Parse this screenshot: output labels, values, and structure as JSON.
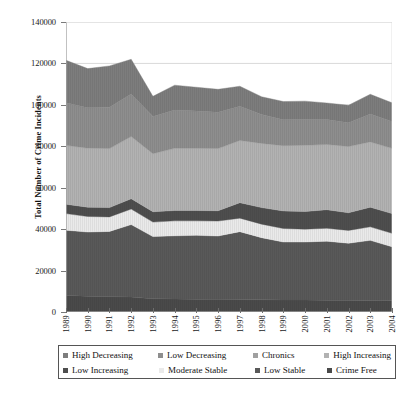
{
  "chart_data": {
    "type": "area",
    "stacked": true,
    "title": "",
    "xlabel": "",
    "ylabel": "Total Number of Crime Incidents",
    "ylim": [
      0,
      140000
    ],
    "ytick_values": [
      0,
      20000,
      40000,
      60000,
      80000,
      100000,
      120000,
      140000
    ],
    "ytick_labels": [
      "0",
      "20000",
      "40000",
      "60000",
      "80000",
      "100000",
      "120000",
      "140000"
    ],
    "grid": true,
    "legend_position": "bottom",
    "categories": [
      "1989",
      "1990",
      "1991",
      "1992",
      "1993",
      "1994",
      "1995",
      "1996",
      "1997",
      "1998",
      "1999",
      "2000",
      "2001",
      "2002",
      "2003",
      "2004"
    ],
    "series": [
      {
        "name": "Crime Free",
        "color": "#4a4a4a",
        "values": [
          8000,
          7600,
          7400,
          7200,
          6400,
          6300,
          6200,
          6100,
          6000,
          5900,
          5800,
          5800,
          5700,
          5700,
          5600,
          5500
        ]
      },
      {
        "name": "Low Stable",
        "color": "#595959",
        "values": [
          31500,
          31000,
          31500,
          35000,
          30000,
          30500,
          30800,
          30600,
          32800,
          30000,
          28000,
          28000,
          28500,
          27500,
          29000,
          26000
        ]
      },
      {
        "name": "Moderate Stable",
        "color": "#eaeaea",
        "values": [
          8000,
          7500,
          7000,
          7500,
          7000,
          7200,
          7000,
          7200,
          6500,
          6500,
          6500,
          6200,
          6200,
          6200,
          6500,
          6500
        ]
      },
      {
        "name": "Low Increasing",
        "color": "#4e4e4e",
        "values": [
          4500,
          4500,
          4500,
          5000,
          5000,
          5000,
          5000,
          5000,
          7500,
          8000,
          8500,
          8500,
          9000,
          8500,
          9500,
          9500
        ]
      },
      {
        "name": "High Increasing",
        "color": "#b2b2b2",
        "values": [
          28500,
          28500,
          28500,
          30000,
          28000,
          30000,
          30000,
          30000,
          30000,
          31000,
          31500,
          32000,
          31500,
          32000,
          31500,
          31500
        ]
      },
      {
        "name": "Chronics",
        "color": "#a0a0a0",
        "values": [
          0,
          0,
          0,
          0,
          0,
          0,
          0,
          0,
          0,
          0,
          0,
          0,
          0,
          0,
          0,
          0
        ]
      },
      {
        "name": "Low Decreasing",
        "color": "#8e8e8e",
        "values": [
          20500,
          19500,
          20000,
          20500,
          18000,
          18500,
          18000,
          17500,
          16500,
          14000,
          12500,
          12500,
          12000,
          11500,
          13500,
          13000
        ]
      },
      {
        "name": "High Decreasing",
        "color": "#7d7d7d",
        "values": [
          20500,
          18900,
          19900,
          16800,
          9700,
          12000,
          11500,
          11100,
          9700,
          8500,
          8800,
          8800,
          8000,
          8400,
          9500,
          9000
        ]
      }
    ],
    "stack_order_bottom_to_top": [
      "Crime Free",
      "Low Stable",
      "Moderate Stable",
      "Low Increasing",
      "High Increasing",
      "Chronics",
      "Low Decreasing",
      "High Decreasing"
    ],
    "totals": [
      121500,
      117500,
      118800,
      122000,
      104100,
      109500,
      108500,
      107500,
      109000,
      103900,
      101600,
      101800,
      100900,
      99800,
      105100,
      101000
    ]
  },
  "legend": {
    "row1": [
      {
        "label": "High Decreasing",
        "color": "#7d7d7d"
      },
      {
        "label": "Low Decreasing",
        "color": "#8e8e8e"
      },
      {
        "label": "Chronics",
        "color": "#a0a0a0"
      },
      {
        "label": "High Increasing",
        "color": "#b2b2b2"
      }
    ],
    "row2": [
      {
        "label": "Low Increasing",
        "color": "#4e4e4e"
      },
      {
        "label": "Moderate Stable",
        "color": "#eaeaea"
      },
      {
        "label": "Low Stable",
        "color": "#595959"
      },
      {
        "label": "Crime Free",
        "color": "#4a4a4a"
      }
    ]
  },
  "axes": {
    "y_title": "Total Number of Crime Incidents"
  }
}
